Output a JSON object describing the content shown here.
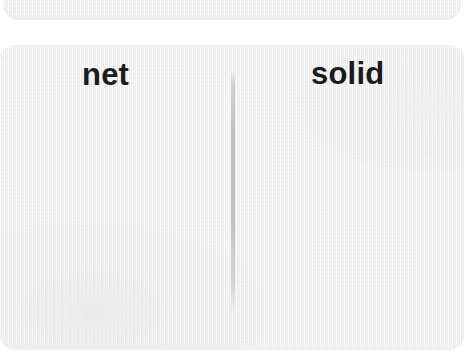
{
  "image": {
    "kind": "scanned-label-card",
    "width": 464,
    "height": 358,
    "background_color": "#ffffff"
  },
  "cards": {
    "top_partial": {
      "name": "partial card clipped at top edge",
      "texture": "woven paper",
      "fill_color": "#eff0f0"
    },
    "main": {
      "name": "main label card",
      "texture": "woven paper",
      "fill_color": "#eff0f0"
    }
  },
  "labels": {
    "left": {
      "text": "net",
      "color": "#1b1b1b",
      "weight": "bold"
    },
    "right": {
      "text": "solid",
      "color": "#1b1b1b",
      "weight": "bold"
    }
  },
  "crease": {
    "name": "vertical fold line",
    "color": "#aaadaf",
    "orientation": "vertical"
  }
}
